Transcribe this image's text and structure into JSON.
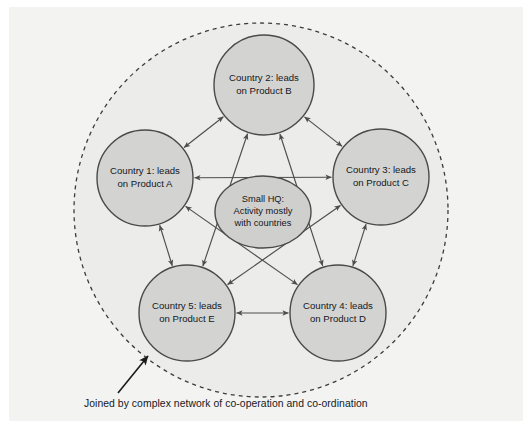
{
  "figure": {
    "caption": "Joined by complex network of co-operation and co-ordination",
    "background_color": "#f3f3f2",
    "node_fill": "#d3d3d1",
    "node_stroke": "#4a4a48",
    "boundary_fill": "#ececeb",
    "boundary_stroke": "#3c3c3a",
    "link_color": "#4d4d4b",
    "pointer_color": "#1b1b1b"
  },
  "boundary": {
    "name": "network-boundary",
    "style": "dashed-circle",
    "cx": 261,
    "cy": 210,
    "r": 187
  },
  "nodes": [
    {
      "id": "country-1",
      "line1": "Country 1: leads",
      "line2": "on Product A",
      "cx": 145,
      "cy": 178,
      "r": 48
    },
    {
      "id": "country-2",
      "line1": "Country 2: leads",
      "line2": "on Product B",
      "cx": 264,
      "cy": 85,
      "r": 50
    },
    {
      "id": "country-3",
      "line1": "Country 3: leads",
      "line2": "on Product C",
      "cx": 381,
      "cy": 177,
      "r": 48
    },
    {
      "id": "country-4",
      "line1": "Country 4: leads",
      "line2": "on Product D",
      "cx": 338,
      "cy": 313,
      "r": 48
    },
    {
      "id": "country-5",
      "line1": "Country 5: leads",
      "line2": "on Product E",
      "cx": 187,
      "cy": 313,
      "r": 48
    }
  ],
  "hq": {
    "id": "small-hq",
    "line1": "Small HQ:",
    "line2": "Activity mostly",
    "line3": "with countries",
    "cx": 263,
    "cy": 212,
    "rx": 48,
    "ry": 36
  },
  "links": [
    {
      "from": "country-1",
      "to": "country-2",
      "arrows": "both"
    },
    {
      "from": "country-1",
      "to": "country-3",
      "arrows": "both"
    },
    {
      "from": "country-1",
      "to": "country-4",
      "arrows": "both"
    },
    {
      "from": "country-1",
      "to": "country-5",
      "arrows": "both"
    },
    {
      "from": "country-2",
      "to": "country-3",
      "arrows": "both"
    },
    {
      "from": "country-2",
      "to": "country-4",
      "arrows": "both"
    },
    {
      "from": "country-2",
      "to": "country-5",
      "arrows": "both"
    },
    {
      "from": "country-3",
      "to": "country-4",
      "arrows": "both"
    },
    {
      "from": "country-3",
      "to": "country-5",
      "arrows": "both"
    },
    {
      "from": "country-4",
      "to": "country-5",
      "arrows": "both"
    }
  ],
  "pointer": {
    "name": "caption-pointer",
    "from_x": 118,
    "from_y": 393,
    "to_x": 148,
    "to_y": 356
  }
}
